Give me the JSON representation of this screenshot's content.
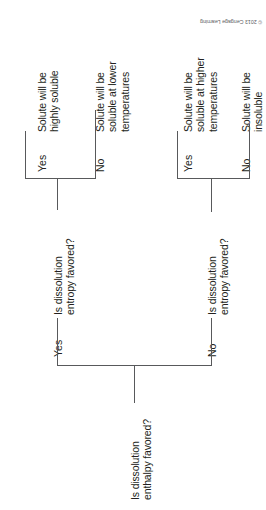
{
  "figure": {
    "kind": "decision-tree-flowchart",
    "orientation": "rotated-90-ccw",
    "line_color": "#58595b",
    "text_color": "#231f20",
    "background": "#ffffff",
    "credit": "© 2013 Cengage Learning"
  },
  "root": {
    "question_line1": "Is dissolution",
    "question_line2": "enthalpy favored?"
  },
  "branches": {
    "yes_label": "Yes",
    "no_label": "No"
  },
  "nodes": {
    "entropy_q_top": {
      "line1": "Is dissolution",
      "line2": "entropy favored?"
    },
    "entropy_q_bottom": {
      "line1": "Is dissolution",
      "line2": "entropy favored?"
    }
  },
  "leaves": {
    "highly_soluble": {
      "line1": "Solute will be",
      "line2": "highly soluble",
      "line3": ""
    },
    "soluble_lower_temp": {
      "line1": "Solute will be",
      "line2": "soluble at lower",
      "line3": "temperatures"
    },
    "soluble_higher_temp": {
      "line1": "Solute will be",
      "line2": "soluble at higher",
      "line3": "temperatures"
    },
    "insoluble": {
      "line1": "Solute will be",
      "line2": "insoluble",
      "line3": ""
    }
  },
  "edge_labels": {
    "root_yes": "Yes",
    "root_no": "No",
    "top_yes": "Yes",
    "top_no": "No",
    "bottom_yes": "Yes",
    "bottom_no": "No"
  }
}
